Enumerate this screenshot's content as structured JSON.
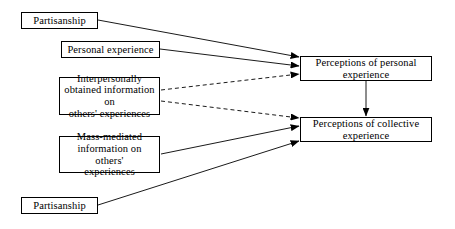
{
  "diagram": {
    "type": "path-model-flow-diagram",
    "background_color": "#ffffff",
    "line_color": "#000000",
    "nodes": [
      {
        "id": "partisanship_top",
        "label": "Partisanship",
        "x": 21,
        "y": 12,
        "w": 77,
        "h": 17
      },
      {
        "id": "personal_experience",
        "label": "Personal experience",
        "x": 61,
        "y": 41,
        "w": 99,
        "h": 17
      },
      {
        "id": "interpersonal_information",
        "label": "Interpersonally\nobtained information on\nothers' experiences",
        "x": 59,
        "y": 77,
        "w": 101,
        "h": 38
      },
      {
        "id": "mass_mediated_information",
        "label": "Mass-mediated\ninformation on others'\nexperiences",
        "x": 59,
        "y": 136,
        "w": 101,
        "h": 37
      },
      {
        "id": "partisanship_bottom",
        "label": "Partisanship",
        "x": 21,
        "y": 197,
        "w": 77,
        "h": 17
      },
      {
        "id": "perceptions_personal",
        "label": "Perceptions of personal\nexperience",
        "x": 300,
        "y": 56,
        "w": 132,
        "h": 25
      },
      {
        "id": "perceptions_collective",
        "label": "Perceptions of collective\nexperience",
        "x": 300,
        "y": 117,
        "w": 132,
        "h": 25
      }
    ],
    "edges": [
      {
        "id": "edge-partisanship-top-to-perceptions-personal",
        "from": "partisanship_top",
        "to": "perceptions_personal",
        "style": "solid",
        "x1": 98,
        "y1": 20,
        "x2": 299,
        "y2": 57
      },
      {
        "id": "edge-personal-experience-to-perceptions-personal",
        "from": "personal_experience",
        "to": "perceptions_personal",
        "style": "solid",
        "x1": 160,
        "y1": 49,
        "x2": 299,
        "y2": 66
      },
      {
        "id": "edge-interpersonal-to-perceptions-personal",
        "from": "interpersonal_information",
        "to": "perceptions_personal",
        "style": "dashed",
        "x1": 161,
        "y1": 90,
        "x2": 299,
        "y2": 74
      },
      {
        "id": "edge-interpersonal-to-perceptions-collective",
        "from": "interpersonal_information",
        "to": "perceptions_collective",
        "style": "dashed",
        "x1": 161,
        "y1": 101,
        "x2": 299,
        "y2": 118
      },
      {
        "id": "edge-mass-mediated-to-perceptions-collective",
        "from": "mass_mediated_information",
        "to": "perceptions_collective",
        "style": "solid",
        "x1": 161,
        "y1": 154,
        "x2": 299,
        "y2": 126
      },
      {
        "id": "edge-partisanship-bottom-to-perceptions-collective",
        "from": "partisanship_bottom",
        "to": "perceptions_collective",
        "style": "solid",
        "x1": 98,
        "y1": 205,
        "x2": 299,
        "y2": 141
      },
      {
        "id": "edge-perceptions-personal-to-perceptions-collective",
        "from": "perceptions_personal",
        "to": "perceptions_collective",
        "style": "solid",
        "x1": 366,
        "y1": 81,
        "x2": 366,
        "y2": 116
      }
    ]
  }
}
